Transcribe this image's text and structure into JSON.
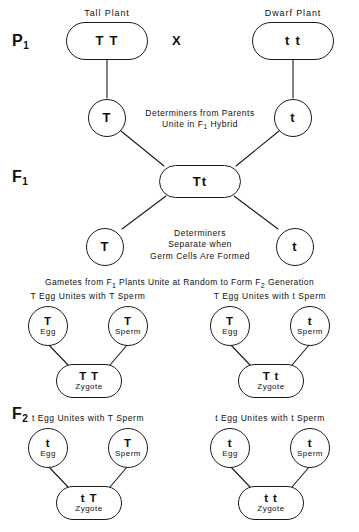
{
  "figure": {
    "background_color": "#ffffff",
    "stroke_color": "#1b1b1b"
  },
  "generations": {
    "p1_label": "P",
    "p1_subscript": "1",
    "f1_label": "F",
    "f1_subscript": "1",
    "f2_label": "F",
    "f2_subscript": "2"
  },
  "p1": {
    "left_plant_title": "Tall Plant",
    "left_genotype": "T T",
    "cross_symbol": "X",
    "right_plant_title": "Dwarf Plant",
    "right_genotype": "t t",
    "gamete_left": "T",
    "gamete_right": "t",
    "caption_line1": "Determiners from Parents",
    "caption_line2_pre": "Unite in F",
    "caption_line2_sub": "1",
    "caption_line2_post": " Hybrid"
  },
  "f1": {
    "hybrid_genotype": "Tt",
    "gamete_left": "T",
    "gamete_right": "t",
    "caption_line1": "Determiners",
    "caption_line2": "Separate when",
    "caption_line3": "Germ Cells Are Formed"
  },
  "f2": {
    "banner_pre": "Gametes from F",
    "banner_sub1": "1",
    "banner_mid": " Plants Unite at Random to Form F",
    "banner_sub2": "2",
    "banner_post": " Generation",
    "crosses": [
      {
        "header": "T Egg Unites with T Sperm",
        "egg_allele": "T",
        "egg_label": "Egg",
        "sperm_allele": "T",
        "sperm_label": "Sperm",
        "zygote_genotype": "T T",
        "zygote_label": "Zygote"
      },
      {
        "header": "T Egg Unites with t Sperm",
        "egg_allele": "T",
        "egg_label": "Egg",
        "sperm_allele": "t",
        "sperm_label": "Sperm",
        "zygote_genotype": "T t",
        "zygote_label": "Zygote"
      },
      {
        "header": "t Egg Unites with T Sperm",
        "egg_allele": "t",
        "egg_label": "Egg",
        "sperm_allele": "T",
        "sperm_label": "Sperm",
        "zygote_genotype": "t T",
        "zygote_label": "Zygote"
      },
      {
        "header": "t Egg Unites with t Sperm",
        "egg_allele": "t",
        "egg_label": "Egg",
        "sperm_allele": "t",
        "sperm_label": "Sperm",
        "zygote_genotype": "t t",
        "zygote_label": "Zygote"
      }
    ]
  }
}
